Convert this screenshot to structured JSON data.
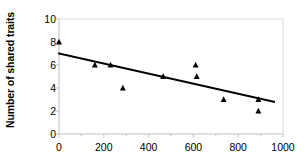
{
  "chart_data": {
    "type": "scatter",
    "title": "",
    "xlabel": "",
    "ylabel": "Number of shared traits",
    "xlim": [
      0,
      1000
    ],
    "ylim": [
      0,
      10
    ],
    "grid": false,
    "legend": "none",
    "x_ticks": [
      0,
      200,
      400,
      600,
      800,
      1000
    ],
    "x_tick_labels": [
      "0",
      "200",
      "400",
      "600",
      "800",
      "1000"
    ],
    "x_minor_ticks": [
      100,
      300,
      500,
      700,
      900
    ],
    "y_ticks": [
      0,
      2,
      4,
      6,
      8,
      10
    ],
    "y_tick_labels": [
      "0",
      "2",
      "4",
      "6",
      "8",
      "10"
    ],
    "marker": "triangle",
    "marker_color": "#000000",
    "points": [
      {
        "x": 0,
        "y": 8
      },
      {
        "x": 160,
        "y": 6
      },
      {
        "x": 230,
        "y": 6
      },
      {
        "x": 285,
        "y": 4
      },
      {
        "x": 465,
        "y": 5
      },
      {
        "x": 610,
        "y": 6
      },
      {
        "x": 615,
        "y": 5
      },
      {
        "x": 735,
        "y": 3
      },
      {
        "x": 890,
        "y": 3
      },
      {
        "x": 890,
        "y": 2
      }
    ],
    "trendline": {
      "type": "line",
      "color": "#000000",
      "points": [
        {
          "x": 0,
          "y": 7.0
        },
        {
          "x": 960,
          "y": 2.8
        }
      ]
    },
    "axis_color": "#bfbfbf",
    "frame_color": "#d9d9d9"
  }
}
